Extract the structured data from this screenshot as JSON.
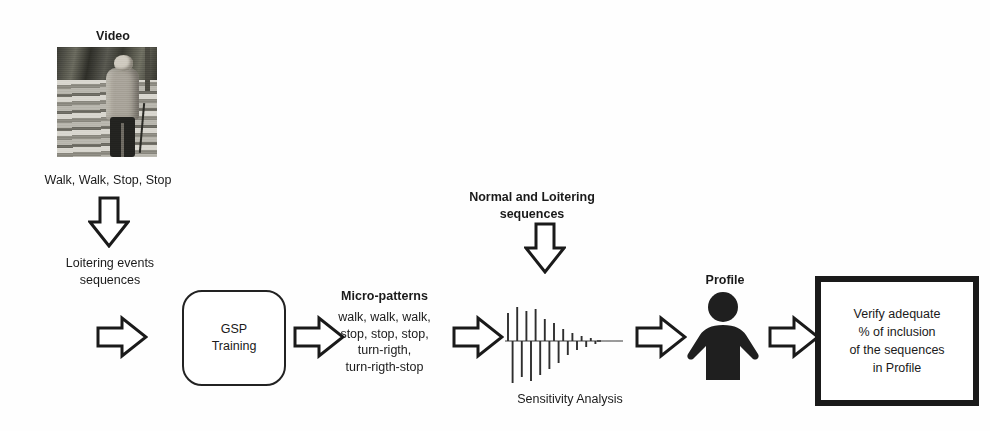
{
  "figure": {
    "domain_type": "pipeline-diagram",
    "background_color": "#fefefe",
    "ink_color": "#1a1a1a"
  },
  "video_stage": {
    "title": "Video",
    "thumbnail_alt": "elderly-person-with-cane-walking-on-steps",
    "caption": "Walk, Walk, Stop, Stop"
  },
  "loitering_stage": {
    "label": "Loitering events\nsequences"
  },
  "gsp_stage": {
    "label": "GSP\nTraining"
  },
  "micro_stage": {
    "title": "Micro-patterns",
    "body": "walk, walk, walk,\nstop, stop, stop,\nturn-rigth,\nturn-rigth-stop"
  },
  "normal_stage": {
    "label": "Normal and Loitering\nsequences"
  },
  "sensitivity_stage": {
    "caption": "Sensitivity Analysis"
  },
  "profile_stage": {
    "title": "Profile"
  },
  "verify_stage": {
    "label": "Verify adequate\n% of inclusion\nof the sequences\nin Profile"
  },
  "arrows": {
    "down_1": "arrow-down",
    "right_1": "arrow-right",
    "right_2": "arrow-right",
    "right_3": "arrow-right",
    "down_2": "arrow-down",
    "right_4": "arrow-right",
    "right_5": "arrow-right"
  },
  "chart_data": {
    "type": "bar",
    "title": "Sensitivity Analysis",
    "xlabel": "",
    "ylabel": "",
    "grid": false,
    "legend": null,
    "axis_line": "horizontal-center",
    "note": "damped alternating stem plot decaying left-to-right, trailing dashes",
    "x": [
      0,
      1,
      2,
      3,
      4,
      5,
      6,
      7,
      8,
      9,
      10,
      11,
      12,
      13,
      14,
      15,
      16,
      17,
      18,
      19
    ],
    "values": [
      28,
      -42,
      34,
      -36,
      30,
      -40,
      32,
      -34,
      22,
      -28,
      18,
      -22,
      12,
      -14,
      8,
      -9,
      5,
      -6,
      3,
      -3
    ],
    "ylim": [
      -48,
      40
    ]
  }
}
